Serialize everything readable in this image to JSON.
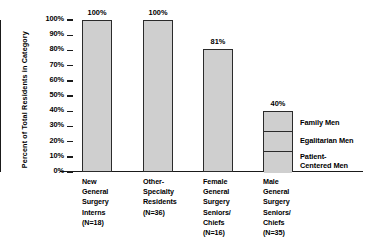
{
  "chart_data": {
    "type": "bar",
    "title": "",
    "xlabel": "",
    "ylabel": "Percent of Total Residents in Category",
    "ylim": [
      0,
      100
    ],
    "grid": false,
    "stacked_series_note": "Only the final category is broken into stacked segments",
    "legend_position": "right-inside",
    "categories": [
      "New\nGeneral\nSurgery\nInterns\n(N=18)",
      "Other-\nSpecialty\nResidents\n(N=36)",
      "Female\nGeneral\nSurgery\nSeniors/\nChiefs\n(N=16)",
      "Male\nGeneral\nSurgery\nSeniors/\nChiefs\n(N=35)"
    ],
    "values": [
      100,
      100,
      81,
      40
    ],
    "value_labels": [
      "100%",
      "100%",
      "81%",
      "40%"
    ],
    "ytick_labels": [
      "100%",
      "90%",
      "80%",
      "70%",
      "60%",
      "50%",
      "40%",
      "30%",
      "20%",
      "10%",
      "0%"
    ],
    "ytick_values": [
      100,
      90,
      80,
      70,
      60,
      50,
      40,
      30,
      20,
      10,
      0
    ],
    "legend": [
      "Family Men",
      "Egalitarian Men",
      "Patient-\nCentered Men"
    ],
    "last_bar_segments": [
      {
        "name": "Family Men",
        "value": 13
      },
      {
        "name": "Egalitarian Men",
        "value": 13
      },
      {
        "name": "Patient-Centered Men",
        "value": 14
      }
    ],
    "colors": {
      "bar_fill": "#cfcfcf",
      "bar_edge": "#2b2b2b",
      "axis": "#1a1a1a",
      "text": "#000000",
      "background": "#ffffff"
    }
  }
}
